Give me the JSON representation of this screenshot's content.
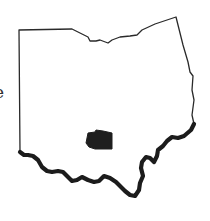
{
  "map": {
    "region": "Ohio",
    "highlighted_area": "county",
    "edge_text": "e",
    "colors": {
      "background": "#ffffff",
      "outline": "#2a2a2a",
      "river": "#1c1c1c",
      "highlight": "#1e1e1e"
    }
  }
}
